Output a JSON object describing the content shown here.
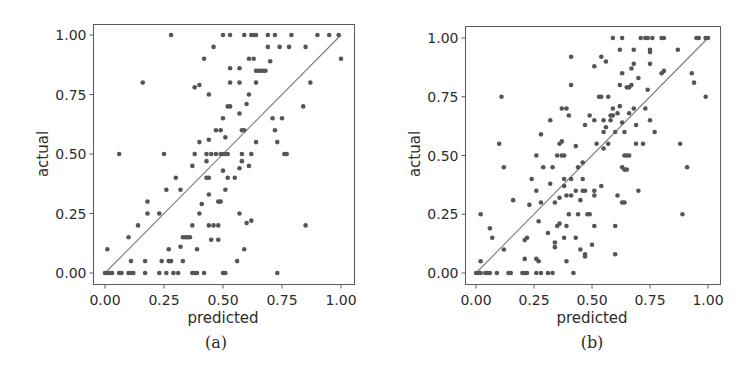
{
  "chart_data": [
    {
      "type": "scatter",
      "caption": "(a)",
      "title": "",
      "xlabel": "predicted",
      "ylabel": "actual",
      "xlim": [
        -0.02,
        1.05
      ],
      "ylim": [
        -0.05,
        1.05
      ],
      "xticks": [
        "0.00",
        "0.25",
        "0.50",
        "0.75",
        "1.00"
      ],
      "yticks": [
        "0.00",
        "0.25",
        "0.50",
        "0.75",
        "1.00"
      ],
      "grid": false,
      "reference_line": {
        "from": [
          0,
          0
        ],
        "to": [
          1,
          1
        ],
        "label": "y = x"
      },
      "points": [
        [
          0.0,
          0.0
        ],
        [
          0.01,
          0.0
        ],
        [
          0.02,
          0.0
        ],
        [
          0.03,
          0.0
        ],
        [
          0.01,
          0.1
        ],
        [
          0.06,
          0.0
        ],
        [
          0.07,
          0.0
        ],
        [
          0.06,
          0.5
        ],
        [
          0.1,
          0.0
        ],
        [
          0.11,
          0.0
        ],
        [
          0.12,
          0.0
        ],
        [
          0.11,
          0.05
        ],
        [
          0.1,
          0.15
        ],
        [
          0.14,
          0.2
        ],
        [
          0.17,
          0.0
        ],
        [
          0.17,
          0.05
        ],
        [
          0.16,
          0.8
        ],
        [
          0.18,
          0.25
        ],
        [
          0.18,
          0.3
        ],
        [
          0.23,
          0.0
        ],
        [
          0.23,
          0.25
        ],
        [
          0.24,
          0.05
        ],
        [
          0.25,
          0.5
        ],
        [
          0.26,
          0.0
        ],
        [
          0.26,
          0.35
        ],
        [
          0.27,
          0.05
        ],
        [
          0.27,
          0.1
        ],
        [
          0.28,
          0.05
        ],
        [
          0.28,
          1.0
        ],
        [
          0.29,
          0.0
        ],
        [
          0.3,
          0.4
        ],
        [
          0.31,
          0.0
        ],
        [
          0.32,
          0.11
        ],
        [
          0.32,
          0.35
        ],
        [
          0.33,
          0.05
        ],
        [
          0.33,
          0.15
        ],
        [
          0.34,
          0.15
        ],
        [
          0.35,
          0.15
        ],
        [
          0.36,
          0.15
        ],
        [
          0.37,
          0.0
        ],
        [
          0.37,
          0.2
        ],
        [
          0.37,
          0.45
        ],
        [
          0.38,
          0.0
        ],
        [
          0.38,
          0.5
        ],
        [
          0.38,
          0.78
        ],
        [
          0.39,
          0.0
        ],
        [
          0.39,
          0.1
        ],
        [
          0.4,
          0.25
        ],
        [
          0.4,
          0.55
        ],
        [
          0.4,
          0.79
        ],
        [
          0.41,
          0.29
        ],
        [
          0.42,
          0.0
        ],
        [
          0.42,
          0.9
        ],
        [
          0.43,
          0.4
        ],
        [
          0.43,
          0.47
        ],
        [
          0.43,
          0.5
        ],
        [
          0.44,
          0.4
        ],
        [
          0.44,
          0.56
        ],
        [
          0.44,
          0.75
        ],
        [
          0.44,
          0.2
        ],
        [
          0.44,
          0.33
        ],
        [
          0.45,
          0.14
        ],
        [
          0.45,
          0.5
        ],
        [
          0.46,
          0.2
        ],
        [
          0.46,
          0.95
        ],
        [
          0.47,
          0.5
        ],
        [
          0.47,
          0.6
        ],
        [
          0.48,
          0.3
        ],
        [
          0.48,
          0.14
        ],
        [
          0.48,
          0.2
        ],
        [
          0.49,
          0.3
        ],
        [
          0.49,
          0.5
        ],
        [
          0.49,
          0.6
        ],
        [
          0.5,
          0.0
        ],
        [
          0.5,
          0.43
        ],
        [
          0.5,
          0.5
        ],
        [
          0.5,
          0.65
        ],
        [
          0.5,
          1.0
        ],
        [
          0.51,
          0.0
        ],
        [
          0.51,
          0.35
        ],
        [
          0.51,
          0.5
        ],
        [
          0.51,
          0.57
        ],
        [
          0.52,
          0.4
        ],
        [
          0.52,
          0.5
        ],
        [
          0.52,
          0.7
        ],
        [
          0.53,
          0.7
        ],
        [
          0.53,
          0.8
        ],
        [
          0.53,
          0.86
        ],
        [
          0.53,
          1.0
        ],
        [
          0.55,
          0.4
        ],
        [
          0.56,
          0.05
        ],
        [
          0.57,
          0.86
        ],
        [
          0.57,
          0.8
        ],
        [
          0.57,
          0.67
        ],
        [
          0.57,
          0.44
        ],
        [
          0.57,
          0.25
        ],
        [
          0.58,
          0.47
        ],
        [
          0.58,
          0.5
        ],
        [
          0.58,
          0.6
        ],
        [
          0.59,
          0.6
        ],
        [
          0.59,
          0.1
        ],
        [
          0.59,
          1.0
        ],
        [
          0.6,
          0.71
        ],
        [
          0.6,
          0.21
        ],
        [
          0.61,
          0.45
        ],
        [
          0.61,
          0.75
        ],
        [
          0.61,
          0.9
        ],
        [
          0.62,
          1.0
        ],
        [
          0.62,
          0.5
        ],
        [
          0.62,
          0.22
        ],
        [
          0.63,
          0.9
        ],
        [
          0.63,
          1.0
        ],
        [
          0.64,
          1.0
        ],
        [
          0.64,
          0.55
        ],
        [
          0.64,
          0.8
        ],
        [
          0.64,
          0.85
        ],
        [
          0.65,
          0.85
        ],
        [
          0.66,
          0.85
        ],
        [
          0.67,
          0.85
        ],
        [
          0.68,
          0.85
        ],
        [
          0.69,
          0.95
        ],
        [
          0.69,
          1.0
        ],
        [
          0.7,
          0.89
        ],
        [
          0.71,
          0.65
        ],
        [
          0.72,
          1.0
        ],
        [
          0.72,
          0.6
        ],
        [
          0.73,
          0.55
        ],
        [
          0.73,
          0.0
        ],
        [
          0.74,
          0.95
        ],
        [
          0.75,
          0.65
        ],
        [
          0.76,
          0.5
        ],
        [
          0.77,
          0.5
        ],
        [
          0.78,
          0.95
        ],
        [
          0.79,
          1.0
        ],
        [
          0.84,
          0.7
        ],
        [
          0.85,
          0.95
        ],
        [
          0.85,
          0.2
        ],
        [
          0.87,
          0.8
        ],
        [
          0.9,
          1.0
        ],
        [
          0.95,
          1.0
        ],
        [
          0.99,
          1.0
        ],
        [
          1.0,
          0.9
        ]
      ]
    },
    {
      "type": "scatter",
      "caption": "(b)",
      "title": "",
      "xlabel": "predicted",
      "ylabel": "actual",
      "xlim": [
        -0.05,
        1.05
      ],
      "ylim": [
        -0.05,
        1.05
      ],
      "xticks": [
        "0.00",
        "0.25",
        "0.50",
        "0.75",
        "1.00"
      ],
      "yticks": [
        "0.00",
        "0.25",
        "0.50",
        "0.75",
        "1.00"
      ],
      "grid": false,
      "reference_line": {
        "from": [
          0,
          0
        ],
        "to": [
          1,
          1
        ],
        "label": "y = x"
      },
      "points": [
        [
          0.0,
          0.0
        ],
        [
          0.01,
          0.0
        ],
        [
          0.02,
          0.0
        ],
        [
          0.02,
          0.05
        ],
        [
          0.02,
          0.25
        ],
        [
          0.04,
          0.0
        ],
        [
          0.05,
          0.0
        ],
        [
          0.06,
          0.0
        ],
        [
          0.06,
          0.19
        ],
        [
          0.07,
          0.15
        ],
        [
          0.09,
          0.0
        ],
        [
          0.1,
          0.55
        ],
        [
          0.11,
          0.75
        ],
        [
          0.12,
          0.45
        ],
        [
          0.12,
          0.1
        ],
        [
          0.14,
          0.0
        ],
        [
          0.15,
          0.0
        ],
        [
          0.16,
          0.31
        ],
        [
          0.2,
          0.0
        ],
        [
          0.21,
          0.0
        ],
        [
          0.21,
          0.14
        ],
        [
          0.21,
          0.06
        ],
        [
          0.22,
          0.15
        ],
        [
          0.22,
          0.0
        ],
        [
          0.23,
          0.29
        ],
        [
          0.24,
          0.4
        ],
        [
          0.26,
          0.5
        ],
        [
          0.26,
          0.35
        ],
        [
          0.26,
          0.06
        ],
        [
          0.26,
          0.0
        ],
        [
          0.27,
          0.05
        ],
        [
          0.27,
          0.22
        ],
        [
          0.28,
          0.0
        ],
        [
          0.28,
          0.3
        ],
        [
          0.28,
          0.59
        ],
        [
          0.29,
          0.45
        ],
        [
          0.31,
          0.0
        ],
        [
          0.31,
          0.17
        ],
        [
          0.32,
          0.38
        ],
        [
          0.32,
          0.65
        ],
        [
          0.33,
          0.45
        ],
        [
          0.33,
          0.0
        ],
        [
          0.34,
          0.3
        ],
        [
          0.34,
          0.11
        ],
        [
          0.34,
          0.13
        ],
        [
          0.35,
          0.2
        ],
        [
          0.35,
          0.5
        ],
        [
          0.36,
          0.21
        ],
        [
          0.36,
          0.32
        ],
        [
          0.36,
          0.55
        ],
        [
          0.37,
          0.5
        ],
        [
          0.37,
          0.56
        ],
        [
          0.37,
          0.7
        ],
        [
          0.38,
          0.37
        ],
        [
          0.38,
          0.4
        ],
        [
          0.38,
          0.15
        ],
        [
          0.38,
          0.5
        ],
        [
          0.39,
          0.33
        ],
        [
          0.39,
          0.7
        ],
        [
          0.39,
          0.2
        ],
        [
          0.39,
          0.05
        ],
        [
          0.4,
          0.67
        ],
        [
          0.4,
          0.25
        ],
        [
          0.41,
          0.33
        ],
        [
          0.41,
          0.4
        ],
        [
          0.41,
          0.8
        ],
        [
          0.41,
          0.92
        ],
        [
          0.42,
          0.0
        ],
        [
          0.43,
          0.15
        ],
        [
          0.43,
          0.35
        ],
        [
          0.43,
          0.54
        ],
        [
          0.44,
          0.25
        ],
        [
          0.44,
          0.45
        ],
        [
          0.45,
          0.1
        ],
        [
          0.45,
          0.31
        ],
        [
          0.46,
          0.35
        ],
        [
          0.46,
          0.47
        ],
        [
          0.46,
          0.4
        ],
        [
          0.47,
          0.35
        ],
        [
          0.47,
          0.07
        ],
        [
          0.47,
          0.08
        ],
        [
          0.47,
          0.63
        ],
        [
          0.48,
          0.25
        ],
        [
          0.49,
          0.25
        ],
        [
          0.49,
          0.67
        ],
        [
          0.5,
          0.12
        ],
        [
          0.51,
          0.88
        ],
        [
          0.51,
          0.35
        ],
        [
          0.51,
          0.2
        ],
        [
          0.51,
          0.33
        ],
        [
          0.51,
          0.65
        ],
        [
          0.52,
          0.55
        ],
        [
          0.53,
          0.75
        ],
        [
          0.54,
          0.75
        ],
        [
          0.54,
          0.92
        ],
        [
          0.54,
          0.37
        ],
        [
          0.55,
          0.6
        ],
        [
          0.55,
          0.65
        ],
        [
          0.55,
          0.53
        ],
        [
          0.56,
          0.9
        ],
        [
          0.56,
          0.62
        ],
        [
          0.57,
          0.75
        ],
        [
          0.57,
          0.55
        ],
        [
          0.58,
          0.65
        ],
        [
          0.58,
          0.67
        ],
        [
          0.59,
          0.67
        ],
        [
          0.59,
          1.0
        ],
        [
          0.59,
          0.7
        ],
        [
          0.6,
          0.6
        ],
        [
          0.6,
          0.2
        ],
        [
          0.6,
          0.08
        ],
        [
          0.61,
          0.33
        ],
        [
          0.61,
          0.68
        ],
        [
          0.62,
          0.95
        ],
        [
          0.62,
          0.8
        ],
        [
          0.62,
          0.71
        ],
        [
          0.63,
          0.3
        ],
        [
          0.63,
          0.45
        ],
        [
          0.63,
          0.64
        ],
        [
          0.63,
          1.0
        ],
        [
          0.63,
          0.85
        ],
        [
          0.64,
          0.3
        ],
        [
          0.64,
          0.44
        ],
        [
          0.64,
          0.5
        ],
        [
          0.64,
          0.6
        ],
        [
          0.65,
          0.44
        ],
        [
          0.65,
          0.79
        ],
        [
          0.65,
          0.5
        ],
        [
          0.66,
          0.79
        ],
        [
          0.66,
          0.5
        ],
        [
          0.66,
          0.68
        ],
        [
          0.67,
          0.8
        ],
        [
          0.67,
          0.87
        ],
        [
          0.68,
          0.89
        ],
        [
          0.68,
          0.95
        ],
        [
          0.68,
          0.7
        ],
        [
          0.69,
          0.55
        ],
        [
          0.69,
          0.63
        ],
        [
          0.7,
          0.35
        ],
        [
          0.7,
          0.83
        ],
        [
          0.71,
          1.0
        ],
        [
          0.72,
          0.55
        ],
        [
          0.73,
          1.0
        ],
        [
          0.73,
          0.7
        ],
        [
          0.74,
          0.78
        ],
        [
          0.74,
          1.0
        ],
        [
          0.75,
          0.95
        ],
        [
          0.75,
          0.94
        ],
        [
          0.75,
          0.65
        ],
        [
          0.75,
          0.89
        ],
        [
          0.76,
          1.0
        ],
        [
          0.77,
          0.6
        ],
        [
          0.8,
          0.85
        ],
        [
          0.8,
          1.0
        ],
        [
          0.81,
          0.86
        ],
        [
          0.81,
          1.0
        ],
        [
          0.87,
          0.95
        ],
        [
          0.88,
          0.55
        ],
        [
          0.89,
          0.25
        ],
        [
          0.91,
          0.45
        ],
        [
          0.93,
          0.85
        ],
        [
          0.94,
          0.81
        ],
        [
          0.95,
          1.0
        ],
        [
          0.96,
          1.0
        ],
        [
          0.99,
          0.75
        ],
        [
          0.99,
          1.0
        ],
        [
          1.0,
          1.0
        ]
      ]
    }
  ],
  "figure": {
    "panels": [
      {
        "id": "a",
        "caption": "(a)",
        "xlabel": "predicted",
        "ylabel": "actual"
      },
      {
        "id": "b",
        "caption": "(b)",
        "xlabel": "predicted",
        "ylabel": "actual"
      }
    ],
    "colors": {
      "points": "#555555",
      "reference_line": "#7a7a7a",
      "frame": "#5a5a5a",
      "background": "#ffffff"
    }
  }
}
